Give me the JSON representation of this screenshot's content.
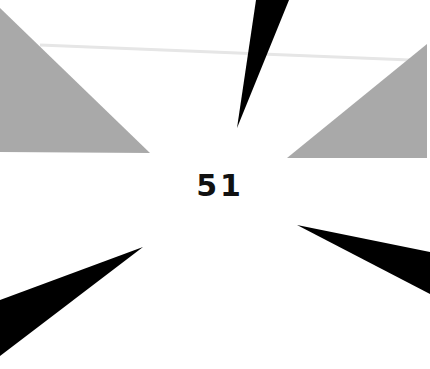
{
  "display": {
    "counter_value": "51"
  },
  "colors": {
    "background": "#ffffff",
    "gray_shape": "#a9a9a9",
    "black_shape": "#000000",
    "faint_line": "#e6e6e6",
    "text": "#111111"
  },
  "shapes": {
    "gray_left": "0,8 150,153 0,152",
    "gray_right": "427,44 427,158 287,158",
    "spike_top": "256,0 289,0 237,128",
    "spike_left": "0,300 143,247 0,356",
    "spike_right": "297,225 430,252 430,294",
    "faint_line": "40,45 410,60"
  }
}
